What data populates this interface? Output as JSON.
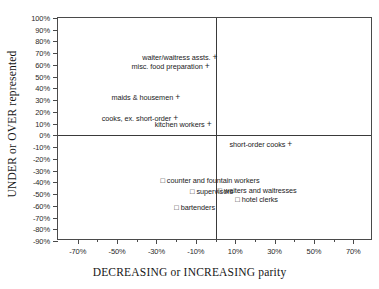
{
  "chart_data": {
    "type": "scatter",
    "title": "",
    "xlabel": "DECREASING or INCREASING parity",
    "ylabel": "UNDER or OVER represented",
    "xlim": [
      -80,
      80
    ],
    "ylim": [
      -90,
      100
    ],
    "grid": false,
    "legend": "none",
    "xticks": [
      "-70%",
      "-50%",
      "-30%",
      "-10%",
      "10%",
      "30%",
      "50%",
      "70%"
    ],
    "xtick_values": [
      -70,
      -50,
      -30,
      -10,
      10,
      30,
      50,
      70
    ],
    "xminor_values": [
      -60,
      -40,
      -20,
      0,
      20,
      40,
      60
    ],
    "yticks": [
      "100%",
      "90%",
      "80%",
      "70%",
      "60%",
      "50%",
      "40%",
      "30%",
      "20%",
      "10%",
      "0%",
      "-10%",
      "-20%",
      "-30%",
      "-40%",
      "-50%",
      "-60%",
      "-70%",
      "-80%",
      "-90%"
    ],
    "ytick_values": [
      100,
      90,
      80,
      70,
      60,
      50,
      40,
      30,
      20,
      10,
      0,
      -10,
      -20,
      -30,
      -40,
      -50,
      -60,
      -70,
      -80,
      -90
    ],
    "zero_lines": {
      "x": 0,
      "y": 0
    },
    "points": [
      {
        "label": "waiter/waitress assts.",
        "marker": "+",
        "x": 1,
        "y": 67,
        "align": "right"
      },
      {
        "label": "misc. food preparation",
        "marker": "+",
        "x": -3,
        "y": 59,
        "align": "right"
      },
      {
        "label": "maids & housemen",
        "marker": "+",
        "x": -18,
        "y": 33,
        "align": "right"
      },
      {
        "label": "cooks, ex. short-order",
        "marker": "+",
        "x": -19,
        "y": 15,
        "align": "right"
      },
      {
        "label": "kitchen workers",
        "marker": "+",
        "x": -2,
        "y": 10,
        "align": "right"
      },
      {
        "label": "short-order cooks",
        "marker": "+",
        "x": 39,
        "y": -7,
        "align": "right"
      },
      {
        "label": "counter and fountain workers",
        "marker": "square",
        "x": -28,
        "y": -39,
        "align": "left"
      },
      {
        "label": "supervisors",
        "marker": "square",
        "x": -13,
        "y": -48,
        "align": "left"
      },
      {
        "label": "waiters and waitresses",
        "marker": "square",
        "x": 1,
        "y": -47,
        "align": "left"
      },
      {
        "label": "hotel clerks",
        "marker": "square",
        "x": 10,
        "y": -55,
        "align": "left"
      },
      {
        "label": "bartenders",
        "marker": "square",
        "x": -21,
        "y": -62,
        "align": "left"
      }
    ],
    "marker_glyphs": {
      "plus": "+",
      "square": "□"
    }
  }
}
